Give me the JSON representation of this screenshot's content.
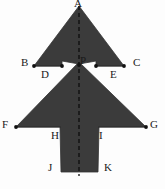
{
  "figure": {
    "fill_color": "#3b3b3b",
    "outline_color": "#2a2a2a",
    "background_color": "#fdfdfd",
    "label_color": "#1a1a1a",
    "dot_color": "#111111",
    "axis": {
      "name": "axis-of-symmetry",
      "style": "dashed",
      "orientation": "vertical",
      "x": 79,
      "y_top": 6,
      "y_bottom": 176
    },
    "labels": [
      {
        "id": "A",
        "text": "A",
        "x": 74,
        "y": -2,
        "role": "apex-vertex"
      },
      {
        "id": "B",
        "text": "B",
        "x": 21,
        "y": 57,
        "role": "vertex"
      },
      {
        "id": "C",
        "text": "C",
        "x": 133,
        "y": 57,
        "role": "vertex"
      },
      {
        "id": "D",
        "text": "D",
        "x": 41,
        "y": 69,
        "role": "vertex"
      },
      {
        "id": "E",
        "text": "E",
        "x": 110,
        "y": 69,
        "role": "vertex"
      },
      {
        "id": "P",
        "text": "P",
        "x": 80,
        "y": 55,
        "role": "interior-point"
      },
      {
        "id": "F",
        "text": "F",
        "x": 2,
        "y": 119,
        "role": "vertex"
      },
      {
        "id": "G",
        "text": "G",
        "x": 150,
        "y": 119,
        "role": "vertex"
      },
      {
        "id": "H",
        "text": "H",
        "x": 51,
        "y": 130,
        "role": "vertex"
      },
      {
        "id": "I",
        "text": "I",
        "x": 99,
        "y": 130,
        "role": "vertex"
      },
      {
        "id": "J",
        "text": "J",
        "x": 48,
        "y": 162,
        "role": "vertex"
      },
      {
        "id": "K",
        "text": "K",
        "x": 104,
        "y": 162,
        "role": "vertex"
      }
    ],
    "dots": [
      {
        "id": "dot-B",
        "x": 34,
        "y": 66
      },
      {
        "id": "dot-D",
        "x": 62,
        "y": 66
      },
      {
        "id": "dot-P",
        "x": 79,
        "y": 65
      },
      {
        "id": "dot-E",
        "x": 96,
        "y": 66
      },
      {
        "id": "dot-C",
        "x": 124,
        "y": 66
      },
      {
        "id": "dot-F",
        "x": 16,
        "y": 127
      },
      {
        "id": "dot-G",
        "x": 146,
        "y": 127
      }
    ],
    "shape_points": "79,6 122,66 96,66 96,62 79,64 62,62 62,66 36,66 79,6",
    "lower_points": "79,66 144,127 98,127 98,172 60,172 60,127 18,127 79,66"
  }
}
